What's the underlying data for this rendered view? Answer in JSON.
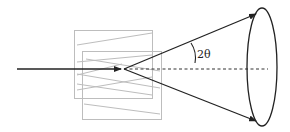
{
  "diagram": {
    "angle_label": "2θ",
    "colors": {
      "beam": "#222222",
      "crystal_outline": "#bdbdbd",
      "axis_dashed": "#333333",
      "cone_base": "#222222"
    },
    "elements": [
      {
        "id": "incident-beam",
        "description": "Incoming beam arrow from left to crystal center"
      },
      {
        "id": "crystal-back-plane",
        "description": "Grey rectangle representing back crystal plane"
      },
      {
        "id": "crystal-front-plane",
        "description": "Grey rectangle representing front crystal plane"
      },
      {
        "id": "lattice-lines",
        "description": "Grey zigzag lattice lines inside crystal"
      },
      {
        "id": "cone-upper-ray",
        "description": "Upper diffracted ray with arrowhead to cone rim"
      },
      {
        "id": "cone-lower-ray",
        "description": "Lower diffracted ray with arrowhead to cone rim"
      },
      {
        "id": "central-axis",
        "description": "Dashed line along the beam axis to cone base"
      },
      {
        "id": "cone-base-ellipse",
        "description": "Ellipse representing the cone base"
      },
      {
        "id": "angle-arc",
        "description": "Arc marking the 2θ angle between axis and upper ray"
      }
    ]
  }
}
